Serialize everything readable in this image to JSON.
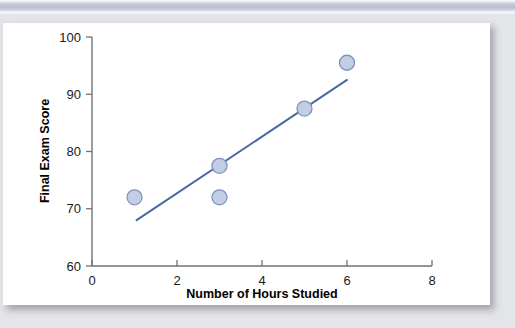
{
  "figure": {
    "background_color": "#e4e5e8",
    "card_color": "#ffffff",
    "band_color": "#b9bfcf"
  },
  "chart_data": {
    "type": "scatter",
    "title": "",
    "subtitle": "",
    "xlabel": "Number of Hours Studied",
    "ylabel": "Final Exam Score",
    "xlim": [
      0,
      8
    ],
    "ylim": [
      60,
      100
    ],
    "xticks": [
      0,
      2,
      4,
      6,
      8
    ],
    "yticks": [
      60,
      70,
      80,
      90,
      100
    ],
    "xtick_labels": [
      "0",
      "2",
      "4",
      "6",
      "8"
    ],
    "ytick_labels": [
      "60",
      "70",
      "80",
      "90",
      "100"
    ],
    "grid": false,
    "legend": false,
    "legend_position": "none",
    "marker_fill_color": "#c2cee4",
    "marker_edge_color": "#7e93bb",
    "line_color": "#4a6a9e",
    "points": [
      {
        "x": 1,
        "y": 72
      },
      {
        "x": 3,
        "y": 77.5
      },
      {
        "x": 3,
        "y": 72
      },
      {
        "x": 5,
        "y": 87.5
      },
      {
        "x": 6,
        "y": 95.5
      }
    ],
    "series": [
      {
        "name": "Students",
        "type": "scatter",
        "x": [
          1,
          3,
          3,
          5,
          6
        ],
        "values": [
          72,
          77.5,
          72,
          87.5,
          95.5
        ]
      },
      {
        "name": "Regression line",
        "type": "line",
        "x": [
          1.05,
          6.0
        ],
        "values": [
          68,
          92.5
        ]
      }
    ],
    "annotations": []
  }
}
